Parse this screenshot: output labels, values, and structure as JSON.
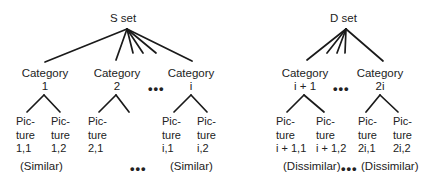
{
  "s_set": {
    "title": "S set",
    "categories": [
      {
        "line1": "Category",
        "line2": "1"
      },
      {
        "line1": "Category",
        "line2": "2"
      },
      {
        "line1": "Category",
        "line2": "i"
      }
    ],
    "pictures": [
      {
        "l1": "Pic-",
        "l2": "ture",
        "l3": "1,1"
      },
      {
        "l1": "Pic-",
        "l2": "ture",
        "l3": "1,2"
      },
      {
        "l1": "Pic-",
        "l2": "ture",
        "l3": "2,1"
      },
      {
        "l1": "Pic-",
        "l2": "ture",
        "l3": "i,1"
      },
      {
        "l1": "Pic-",
        "l2": "ture",
        "l3": "i,2"
      }
    ],
    "notes": [
      "(Similar)",
      "(Similar)"
    ]
  },
  "d_set": {
    "title": "D set",
    "categories": [
      {
        "line1": "Category",
        "line2": "i + 1"
      },
      {
        "line1": "Category",
        "line2": "2i"
      }
    ],
    "pictures": [
      {
        "l1": "Pic-",
        "l2": "ture",
        "l3": "i + 1,1"
      },
      {
        "l1": "Pic-",
        "l2": "ture",
        "l3": "i + 1,2"
      },
      {
        "l1": "Pic-",
        "l2": "ture",
        "l3": "2i,1"
      },
      {
        "l1": "Pic-",
        "l2": "ture",
        "l3": "2i,2"
      }
    ],
    "notes": [
      "(Dissimilar)",
      "(Dissimilar)"
    ]
  },
  "ellipsis": "•••"
}
